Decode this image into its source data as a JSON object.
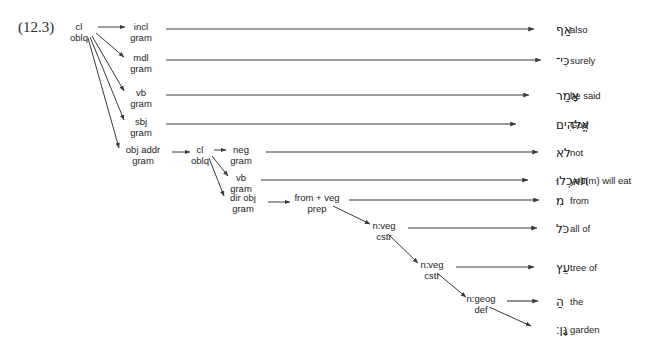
{
  "figure": {
    "number": "(12.3)"
  },
  "nodes": [
    {
      "id": "root",
      "line1": "cl",
      "line2": "oblq",
      "x": 79,
      "y": 27
    },
    {
      "id": "incl",
      "line1": "incl",
      "line2": "gram",
      "x": 141,
      "y": 27
    },
    {
      "id": "mdl",
      "line1": "mdl",
      "line2": "gram",
      "x": 141,
      "y": 58
    },
    {
      "id": "vb1",
      "line1": "vb",
      "line2": "gram",
      "x": 141,
      "y": 93
    },
    {
      "id": "sbj",
      "line1": "sbj",
      "line2": "gram",
      "x": 141,
      "y": 122
    },
    {
      "id": "objaddr",
      "line1": "obj addr",
      "line2": "gram",
      "x": 143,
      "y": 150
    },
    {
      "id": "cl2",
      "line1": "cl",
      "line2": "oblq",
      "x": 200,
      "y": 150
    },
    {
      "id": "neg",
      "line1": "neg",
      "line2": "gram",
      "x": 241,
      "y": 150
    },
    {
      "id": "vb2",
      "line1": "vb",
      "line2": "gram",
      "x": 241,
      "y": 178
    },
    {
      "id": "dirobj",
      "line1": "dir obj",
      "line2": "gram",
      "x": 243,
      "y": 198
    },
    {
      "id": "prep",
      "line1": "from + veg",
      "line2": "prep",
      "x": 317,
      "y": 198
    },
    {
      "id": "nveg1",
      "line1": "n:veg",
      "line2": "cstr",
      "x": 384,
      "y": 226
    },
    {
      "id": "nveg2",
      "line1": "n:veg",
      "line2": "cstr",
      "x": 432,
      "y": 265
    },
    {
      "id": "ngeog",
      "line1": "n:geog",
      "line2": "def",
      "x": 481,
      "y": 299
    }
  ],
  "leaves": [
    {
      "id": "leaf-af",
      "hebrew": "אַף",
      "gloss": "also",
      "y": 27,
      "line_from": 166,
      "line_to": 534
    },
    {
      "id": "leaf-ki",
      "hebrew": "כִּי־",
      "gloss": "surely",
      "y": 58,
      "line_from": 166,
      "line_to": 541
    },
    {
      "id": "leaf-amar",
      "hebrew": "אָמַר",
      "gloss": "he said",
      "y": 93,
      "line_from": 166,
      "line_to": 529
    },
    {
      "id": "leaf-elohim",
      "hebrew": "אֱלֹהִים",
      "gloss": "God",
      "y": 122,
      "line_from": 166,
      "line_to": 516
    },
    {
      "id": "leaf-lo",
      "hebrew": "לֹא",
      "gloss": "not",
      "y": 150,
      "line_from": 266,
      "line_to": 538
    },
    {
      "id": "leaf-tokelu",
      "hebrew": "תֹאכְלוּ",
      "gloss": "you(m) will eat",
      "y": 178,
      "line_from": 261,
      "line_to": 528
    },
    {
      "id": "leaf-mi",
      "hebrew": "מִ",
      "gloss": "from",
      "y": 198,
      "line_from": 349,
      "line_to": 539
    },
    {
      "id": "leaf-kol",
      "hebrew": "כֹּל",
      "gloss": "all of",
      "y": 226,
      "line_from": 408,
      "line_to": 537
    },
    {
      "id": "leaf-ets",
      "hebrew": "עֵץ",
      "gloss": "tree of",
      "y": 265,
      "line_from": 456,
      "line_to": 534
    },
    {
      "id": "leaf-ha",
      "hebrew": "הַ",
      "gloss": "the",
      "y": 299,
      "line_from": 507,
      "line_to": 538
    },
    {
      "id": "leaf-gan",
      "hebrew": "גָּן׃",
      "gloss": "garden",
      "y": 327,
      "line_from": null,
      "line_to": null
    }
  ],
  "edges": [
    {
      "from": "root",
      "to": "incl",
      "x1": 98,
      "y1": 27,
      "x2": 125,
      "y2": 27
    },
    {
      "from": "root",
      "to": "mdl",
      "x1": 96,
      "y1": 33,
      "x2": 124,
      "y2": 57
    },
    {
      "from": "root",
      "to": "vb1",
      "x1": 92,
      "y1": 36,
      "x2": 124,
      "y2": 91
    },
    {
      "from": "root",
      "to": "sbj",
      "x1": 90,
      "y1": 37,
      "x2": 124,
      "y2": 120
    },
    {
      "from": "root",
      "to": "objaddr",
      "x1": 88,
      "y1": 38,
      "x2": 119,
      "y2": 148
    },
    {
      "from": "objaddr",
      "to": "cl2",
      "x1": 172,
      "y1": 152,
      "x2": 190,
      "y2": 152
    },
    {
      "from": "cl2",
      "to": "neg",
      "x1": 214,
      "y1": 150,
      "x2": 226,
      "y2": 150
    },
    {
      "from": "cl2",
      "to": "vb2",
      "x1": 212,
      "y1": 156,
      "x2": 228,
      "y2": 176
    },
    {
      "from": "cl2",
      "to": "dirobj",
      "x1": 209,
      "y1": 158,
      "x2": 224,
      "y2": 196
    },
    {
      "from": "dirobj",
      "to": "prep",
      "x1": 268,
      "y1": 202,
      "x2": 290,
      "y2": 202
    },
    {
      "from": "prep",
      "to": "nveg1",
      "x1": 333,
      "y1": 206,
      "x2": 370,
      "y2": 224
    },
    {
      "from": "nveg1",
      "to": "nveg2",
      "x1": 388,
      "y1": 234,
      "x2": 418,
      "y2": 263
    },
    {
      "from": "nveg2",
      "to": "ngeog",
      "x1": 437,
      "y1": 273,
      "x2": 466,
      "y2": 297
    },
    {
      "from": "ngeog",
      "to": "gan",
      "x1": 489,
      "y1": 307,
      "x2": 531,
      "y2": 326
    }
  ],
  "style": {
    "line_color": "#3a3a3a",
    "text_color": "#232323",
    "background": "#ffffff"
  }
}
